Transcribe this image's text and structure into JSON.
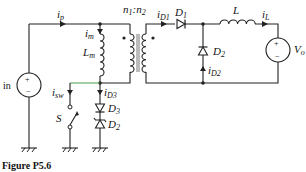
{
  "figure": {
    "caption": "Figure P5.6",
    "type": "circuit-schematic"
  },
  "labels": {
    "i_p": {
      "main": "i",
      "sub": "p"
    },
    "i_m": {
      "main": "i",
      "sub": "m"
    },
    "L_m": {
      "main": "L",
      "sub": "m"
    },
    "ratio": {
      "n1": "n",
      "n1sub": "1",
      "colon": ":",
      "n2": "n",
      "n2sub": "2"
    },
    "i_D1": {
      "main": "i",
      "sub": "D1"
    },
    "D1": {
      "main": "D",
      "sub": "1"
    },
    "L": {
      "main": "L"
    },
    "i_L": {
      "main": "i",
      "sub": "L"
    },
    "D2_out": {
      "main": "D",
      "sub": "2"
    },
    "i_D2": {
      "main": "i",
      "sub": "D2"
    },
    "V_o": {
      "main": "V",
      "sub": "o"
    },
    "source_in": {
      "text": "in"
    },
    "i_sw": {
      "main": "i",
      "sub": "sw"
    },
    "S": {
      "main": "S"
    },
    "i_D3": {
      "main": "i",
      "sub": "D3"
    },
    "D3": {
      "main": "D",
      "sub": "3"
    },
    "D2_zener": {
      "main": "D",
      "sub": "2"
    },
    "plus": "+",
    "minus": "−"
  },
  "components": [
    {
      "id": "Vin",
      "kind": "voltage-source",
      "label": "in"
    },
    {
      "id": "Lm",
      "kind": "inductor",
      "label": "Lm"
    },
    {
      "id": "T",
      "kind": "transformer",
      "label": "n1:n2",
      "dots": "top-primary-left, top-secondary-right"
    },
    {
      "id": "D1",
      "kind": "diode",
      "label": "D1"
    },
    {
      "id": "D2",
      "kind": "diode",
      "label": "D2"
    },
    {
      "id": "L",
      "kind": "inductor",
      "label": "L"
    },
    {
      "id": "Vo",
      "kind": "voltage-source",
      "label": "Vo"
    },
    {
      "id": "S",
      "kind": "switch",
      "label": "S"
    },
    {
      "id": "D3",
      "kind": "diode",
      "label": "D3"
    },
    {
      "id": "Dz",
      "kind": "zener-diode",
      "label": "D2"
    }
  ],
  "colors": {
    "wire": "#222222",
    "accent_wire": "#5aa85a",
    "background": "#ffffff"
  }
}
